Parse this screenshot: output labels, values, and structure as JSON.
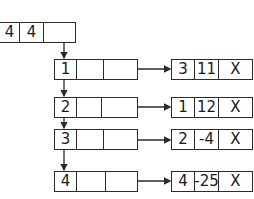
{
  "header_node": {
    "cells": [
      "4",
      "4",
      ""
    ]
  },
  "rows": [
    {
      "index": "1",
      "left_cells": [
        "1",
        "",
        ""
      ],
      "right_cells": [
        "3",
        "11",
        "X"
      ]
    },
    {
      "index": "2",
      "left_cells": [
        "2",
        "",
        ""
      ],
      "right_cells": [
        "1",
        "12",
        "X"
      ]
    },
    {
      "index": "3",
      "left_cells": [
        "3",
        "",
        ""
      ],
      "right_cells": [
        "2",
        "-4",
        "X"
      ]
    },
    {
      "index": "4",
      "left_cells": [
        "4",
        "",
        ""
      ],
      "right_cells": [
        "4",
        "-25",
        "X"
      ]
    }
  ],
  "colors": {
    "stroke": "#2b2b2b",
    "background": "#ffffff"
  }
}
